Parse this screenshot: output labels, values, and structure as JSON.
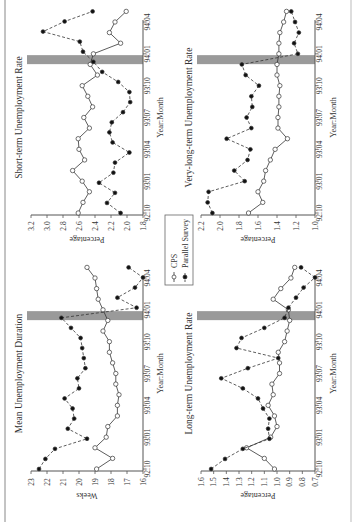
{
  "figure": {
    "legend": {
      "items": [
        {
          "label": "CPS",
          "marker": "open-circle",
          "line": "solid"
        },
        {
          "label": "Parallel Survey",
          "marker": "filled-circle",
          "line": "dashed"
        }
      ]
    },
    "shading_label": "transition period (93:12)",
    "colors": {
      "shade": "#9a9a9a",
      "line": "#333333",
      "axis": "#555555"
    }
  },
  "chart_data": [
    {
      "type": "line",
      "title": "Mean Unemployment Duration",
      "xlabel": "Year:Month",
      "ylabel": "Weeks",
      "ylim": [
        16,
        23
      ],
      "yticks": [
        "16",
        "17",
        "18",
        "19",
        "20",
        "21",
        "22",
        "23"
      ],
      "xticks": [
        "92:10",
        "93:01",
        "93:04",
        "93:07",
        "93:10",
        "94:01",
        "94:04"
      ],
      "x": [
        "92:10",
        "92:11",
        "92:12",
        "93:01",
        "93:02",
        "93:03",
        "93:04",
        "93:05",
        "93:06",
        "93:07",
        "93:08",
        "93:09",
        "93:10",
        "93:11",
        "93:12",
        "94:01",
        "94:02",
        "94:03",
        "94:04",
        "94:05"
      ],
      "shaded_x": "93:12",
      "series": [
        {
          "name": "CPS",
          "values": [
            18.9,
            17.9,
            19.0,
            18.3,
            18.2,
            17.6,
            17.6,
            17.5,
            17.7,
            17.7,
            17.9,
            18.1,
            18.1,
            18.5,
            18.2,
            18.5,
            18.8,
            18.9,
            19.0,
            19.5
          ]
        },
        {
          "name": "Parallel Survey",
          "values": [
            22.5,
            22.1,
            21.5,
            19.5,
            20.7,
            20.3,
            20.4,
            20.9,
            20.0,
            20.1,
            19.6,
            19.7,
            19.8,
            19.9,
            20.5,
            21.1,
            16.4,
            17.6,
            16.5,
            16.0,
            16.9
          ]
        }
      ]
    },
    {
      "type": "line",
      "title": "Short-term Unemployment Rate",
      "xlabel": "Year:Month",
      "ylabel": "Percentage",
      "ylim": [
        1.8,
        3.2
      ],
      "yticks": [
        "1.8",
        "2.0",
        "2.2",
        "2.4",
        "2.6",
        "2.8",
        "3.0",
        "3.2"
      ],
      "xticks": [
        "92:10",
        "93:01",
        "93:04",
        "93:07",
        "93:10",
        "94:01",
        "94:04"
      ],
      "x": [
        "92:10",
        "92:11",
        "92:12",
        "93:01",
        "93:02",
        "93:03",
        "93:04",
        "93:05",
        "93:06",
        "93:07",
        "93:08",
        "93:09",
        "93:10",
        "93:11",
        "93:12",
        "94:01",
        "94:02",
        "94:03",
        "94:04",
        "94:05"
      ],
      "shaded_x": "93:12",
      "series": [
        {
          "name": "CPS",
          "values": [
            2.61,
            2.55,
            2.47,
            2.56,
            2.68,
            2.53,
            2.6,
            2.61,
            2.47,
            2.54,
            2.43,
            2.49,
            2.56,
            2.37,
            2.46,
            2.42,
            2.08,
            2.22,
            2.15,
            2.01
          ]
        },
        {
          "name": "Parallel Survey",
          "values": [
            2.08,
            2.25,
            2.15,
            2.35,
            2.17,
            2.15,
            1.97,
            2.18,
            2.22,
            2.19,
            2.05,
            1.96,
            1.97,
            2.11,
            2.31,
            2.42,
            2.55,
            2.59,
            3.05,
            2.78,
            2.43
          ]
        }
      ]
    },
    {
      "type": "line",
      "title": "Long-term Unemployment Rate",
      "xlabel": "Year:Month",
      "ylabel": "Percentage",
      "ylim": [
        0.7,
        1.6
      ],
      "yticks": [
        "0.7",
        "0.8",
        "0.9",
        "1.0",
        "1.1",
        "1.2",
        "1.3",
        "1.4",
        "1.5",
        "1.6"
      ],
      "xticks": [
        "92:10",
        "93:01",
        "93:04",
        "93:07",
        "93:10",
        "94:01",
        "94:04"
      ],
      "x": [
        "92:10",
        "92:11",
        "92:12",
        "93:01",
        "93:02",
        "93:03",
        "93:04",
        "93:05",
        "93:06",
        "93:07",
        "93:08",
        "93:09",
        "93:10",
        "93:11",
        "93:12",
        "94:01",
        "94:02",
        "94:03",
        "94:04",
        "94:05"
      ],
      "shaded_x": "93:12",
      "series": [
        {
          "name": "CPS",
          "values": [
            1.02,
            1.1,
            1.24,
            1.05,
            1.0,
            1.02,
            1.07,
            1.03,
            1.04,
            0.98,
            0.98,
            0.99,
            0.94,
            0.92,
            0.9,
            0.91,
            1.03,
            0.97,
            0.89,
            0.86
          ]
        },
        {
          "name": "Parallel Survey",
          "values": [
            1.52,
            1.41,
            1.27,
            1.06,
            1.07,
            1.06,
            1.11,
            1.15,
            1.27,
            1.44,
            1.23,
            0.99,
            1.32,
            1.28,
            1.1,
            0.94,
            0.91,
            0.85,
            0.79,
            0.7,
            0.81
          ]
        }
      ]
    },
    {
      "type": "line",
      "title": "Very-long-term Unemployment Rate",
      "xlabel": "Year:Month",
      "ylabel": "Percentage",
      "ylim": [
        1.0,
        2.2
      ],
      "yticks": [
        "1.0",
        "1.2",
        "1.4",
        "1.6",
        "1.8",
        "2.0",
        "2.2"
      ],
      "xticks": [
        "92:10",
        "93:01",
        "93:04",
        "93:07",
        "93:10",
        "94:01",
        "94:04"
      ],
      "x": [
        "92:10",
        "92:11",
        "92:12",
        "93:01",
        "93:02",
        "93:03",
        "93:04",
        "93:05",
        "93:06",
        "93:07",
        "93:08",
        "93:09",
        "93:10",
        "93:11",
        "93:12",
        "94:01",
        "94:02",
        "94:03",
        "94:04",
        "94:05"
      ],
      "shaded_x": "93:12",
      "series": [
        {
          "name": "CPS",
          "values": [
            1.7,
            1.55,
            1.6,
            1.54,
            1.52,
            1.47,
            1.42,
            1.29,
            1.39,
            1.39,
            1.38,
            1.38,
            1.37,
            1.4,
            1.4,
            1.38,
            1.38,
            1.37,
            1.33,
            1.3
          ]
        },
        {
          "name": "Parallel Survey",
          "values": [
            2.08,
            2.13,
            2.12,
            1.74,
            1.85,
            1.71,
            1.68,
            1.93,
            1.67,
            1.72,
            1.66,
            1.67,
            1.59,
            1.73,
            1.77,
            1.18,
            1.22,
            1.17,
            1.21,
            1.25
          ]
        }
      ]
    }
  ]
}
